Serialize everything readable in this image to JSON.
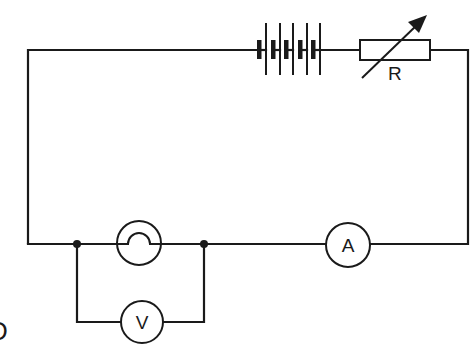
{
  "diagram": {
    "type": "circuit-schematic",
    "stroke_color": "#1a1a1a",
    "background": "#ffffff",
    "components": {
      "battery": {
        "name": "battery",
        "cells": 5
      },
      "rheostat": {
        "name": "variable-resistor",
        "label": "R"
      },
      "lamp": {
        "name": "filament-lamp"
      },
      "ammeter": {
        "name": "ammeter",
        "label": "A"
      },
      "voltmeter": {
        "name": "voltmeter",
        "label": "V"
      }
    },
    "junctions": 2,
    "edge_label": "D"
  }
}
